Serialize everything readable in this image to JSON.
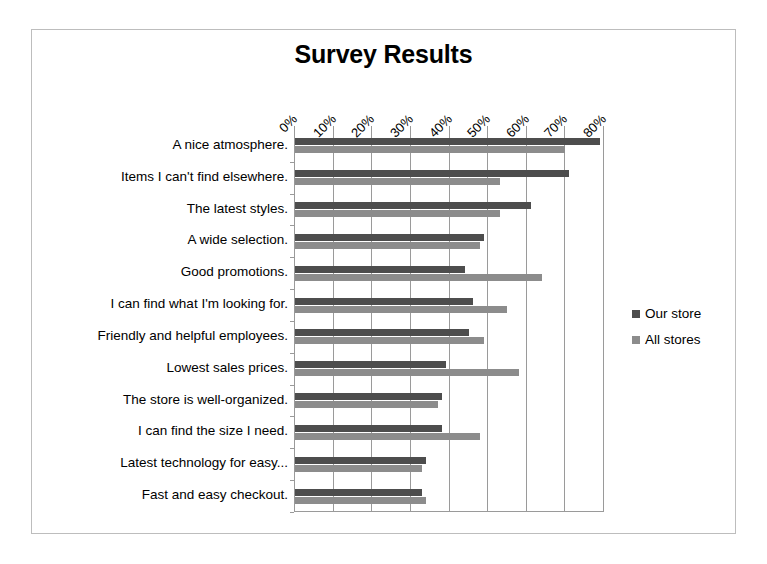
{
  "chart_data": {
    "type": "bar",
    "orientation": "horizontal",
    "title": "Survey Results",
    "xlabel": "",
    "ylabel": "",
    "xlim": [
      0,
      80
    ],
    "xticks": [
      "0%",
      "10%",
      "20%",
      "30%",
      "40%",
      "50%",
      "60%",
      "70%",
      "80%"
    ],
    "xtick_values": [
      0,
      10,
      20,
      30,
      40,
      50,
      60,
      70,
      80
    ],
    "grid": true,
    "legend_position": "right",
    "categories": [
      "A nice atmosphere.",
      "Items I can't find elsewhere.",
      "The latest styles.",
      "A wide selection.",
      "Good promotions.",
      "I can find what I'm looking for.",
      "Friendly and helpful employees.",
      "Lowest sales prices.",
      "The store is well-organized.",
      "I can find the size I need.",
      "Latest technology for easy...",
      "Fast and easy checkout."
    ],
    "series": [
      {
        "name": "Our store",
        "color": "#4d4d4d",
        "values": [
          79,
          71,
          61,
          49,
          44,
          46,
          45,
          39,
          38,
          38,
          34,
          33
        ]
      },
      {
        "name": "All stores",
        "color": "#8c8c8c",
        "values": [
          70,
          53,
          53,
          48,
          64,
          55,
          49,
          58,
          37,
          48,
          33,
          34
        ]
      }
    ]
  },
  "legend": {
    "items": [
      {
        "label": "Our store",
        "color": "#4d4d4d"
      },
      {
        "label": "All stores",
        "color": "#8c8c8c"
      }
    ]
  },
  "colors": {
    "series_our_store": "#4d4d4d",
    "series_all_stores": "#8c8c8c",
    "axis": "#9a9a9a",
    "frame_border": "#bdbdbd",
    "background": "#ffffff"
  }
}
